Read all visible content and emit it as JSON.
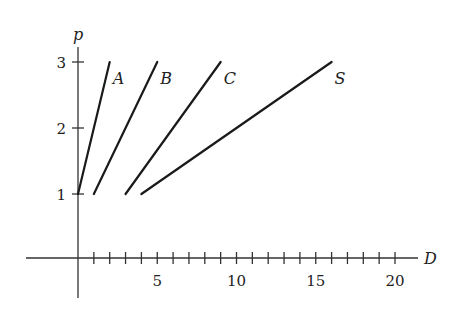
{
  "chart_data": {
    "type": "line",
    "title": "",
    "xlabel": "D",
    "ylabel": "p",
    "xlim": [
      -3,
      21
    ],
    "ylim": [
      -0.6,
      3.2
    ],
    "x_ticks": [
      1,
      2,
      3,
      4,
      5,
      6,
      7,
      8,
      9,
      10,
      11,
      12,
      13,
      14,
      15,
      16,
      17,
      18,
      19,
      20
    ],
    "x_tick_labels": [
      "5",
      "10",
      "15",
      "20"
    ],
    "x_tick_label_values": [
      5,
      10,
      15,
      20
    ],
    "y_tick_labels": [
      "1",
      "2",
      "3"
    ],
    "y_tick_label_values": [
      1,
      2,
      3
    ],
    "grid": false,
    "legend": "none (inline labels)",
    "series": [
      {
        "name": "A",
        "x": [
          0,
          2
        ],
        "y": [
          1,
          3
        ]
      },
      {
        "name": "B",
        "x": [
          1,
          5
        ],
        "y": [
          1,
          3
        ]
      },
      {
        "name": "C",
        "x": [
          3,
          9
        ],
        "y": [
          1,
          3
        ]
      },
      {
        "name": "S",
        "x": [
          4,
          16
        ],
        "y": [
          1,
          3
        ]
      }
    ]
  }
}
